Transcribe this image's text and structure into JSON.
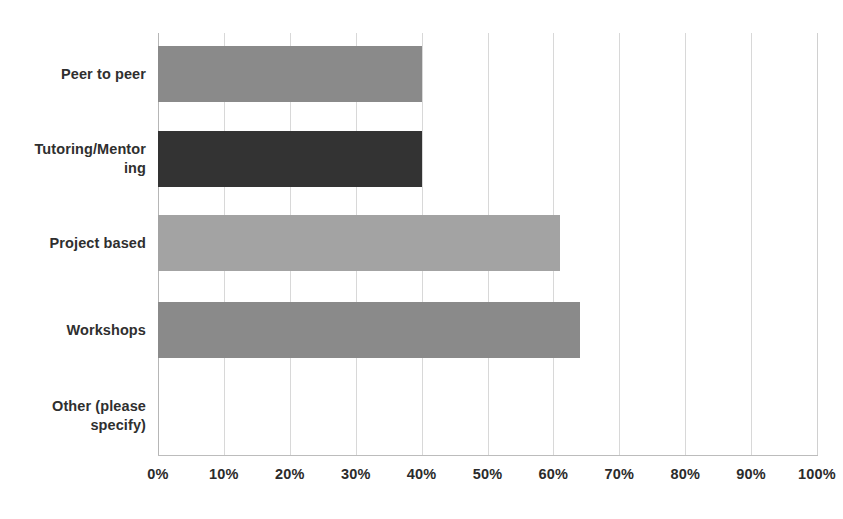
{
  "chart_data": {
    "type": "bar",
    "orientation": "horizontal",
    "title": "",
    "subtitle": "",
    "xlabel": "",
    "ylabel": "",
    "categories": [
      "Peer to peer",
      "Tutoring/Mentoring",
      "Project based",
      "Workshops",
      "Other (please specify)"
    ],
    "category_label_lines": [
      [
        "Peer to peer"
      ],
      [
        "Tutoring/Mentor",
        "ing"
      ],
      [
        "Project based"
      ],
      [
        "Workshops"
      ],
      [
        "Other (please",
        "specify)"
      ]
    ],
    "values": [
      40,
      40,
      61,
      64,
      0
    ],
    "value_labels": [
      "40%",
      "40%",
      "61%",
      "64%",
      "0%"
    ],
    "bar_colors": [
      "#8a8a8a",
      "#333333",
      "#a3a3a3",
      "#8a8a8a",
      "#8a8a8a"
    ],
    "xlim": [
      0,
      100
    ],
    "xticks": [
      0,
      10,
      20,
      30,
      40,
      50,
      60,
      70,
      80,
      90,
      100
    ],
    "xtick_labels": [
      "0%",
      "10%",
      "20%",
      "30%",
      "40%",
      "50%",
      "60%",
      "70%",
      "80%",
      "90%",
      "100%"
    ],
    "grid": "vertical",
    "legend": "none",
    "data_labels_shown": false,
    "background_color": "#ffffff",
    "gridline_color": "#d8d8d8",
    "axis_color": "#b6b6b6",
    "text_color": "#2f2f2f"
  }
}
